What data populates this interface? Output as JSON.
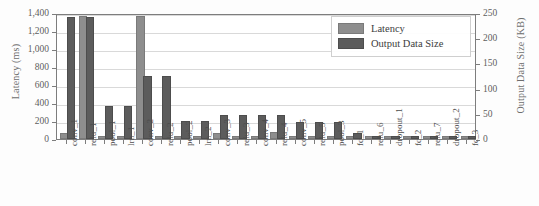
{
  "chart_data": {
    "type": "bar",
    "title": "",
    "xlabel": "",
    "ylabel": "Latency (ms)",
    "y2label": "Output Data Size (KB)",
    "ylim": [
      0,
      1400
    ],
    "y2lim": [
      0,
      250
    ],
    "ytick_labels": [
      "0",
      "200",
      "400",
      "600",
      "800",
      "1,000",
      "1,200",
      "1,400"
    ],
    "ytick_values": [
      0,
      200,
      400,
      600,
      800,
      1000,
      1200,
      1400
    ],
    "y2tick_labels": [
      "0",
      "50",
      "100",
      "150",
      "200",
      "250"
    ],
    "y2tick_values": [
      0,
      50,
      100,
      150,
      200,
      250
    ],
    "grid": true,
    "legend_position": "top-right",
    "categories": [
      "conv_1",
      "relu_1",
      "pool_1",
      "lrn_1",
      "conv_2",
      "relu_2",
      "pool_2",
      "lrn_2",
      "conv_3",
      "relu_3",
      "conv_4",
      "relu_4",
      "conv_5",
      "relu_5",
      "pool_3",
      "fc_1",
      "relu_6",
      "dropout_1",
      "fc_2",
      "relu_7",
      "dropout_2",
      "fc_3"
    ],
    "series": [
      {
        "name": "Latency",
        "axis": "left",
        "unit": "ms",
        "color": "#8e8e8e",
        "values": [
          40,
          1340,
          10,
          10,
          1350,
          10,
          8,
          8,
          40,
          8,
          8,
          55,
          8,
          8,
          8,
          8,
          5,
          5,
          5,
          5,
          5,
          5
        ]
      },
      {
        "name": "Output Data Size",
        "axis": "right",
        "unit": "KB",
        "color": "#5c5c5c",
        "values": [
          239,
          239,
          61,
          61,
          122,
          122,
          31,
          31,
          44,
          44,
          44,
          44,
          30,
          30,
          30,
          7,
          1,
          1,
          1,
          1,
          1,
          1
        ]
      }
    ],
    "bars_left_ms": [
      40,
      1340,
      10,
      10,
      1350,
      10,
      8,
      8,
      40,
      8,
      8,
      55,
      8,
      8,
      8,
      8,
      5,
      5,
      5,
      5,
      5,
      5
    ],
    "bars_right_kb": [
      239,
      239,
      61,
      61,
      122,
      122,
      31,
      31,
      44,
      44,
      44,
      44,
      30,
      30,
      30,
      7,
      1,
      1,
      1,
      1,
      1,
      1
    ]
  },
  "legend": {
    "items": [
      {
        "label": "Latency",
        "color": "#8e8e8e"
      },
      {
        "label": "Output Data Size",
        "color": "#5c5c5c"
      }
    ]
  },
  "axes": {
    "left_title": "Latency (ms)",
    "right_title": "Output Data Size (KB)"
  }
}
